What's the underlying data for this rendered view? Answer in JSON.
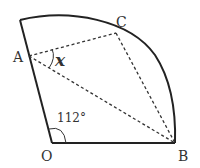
{
  "diagram": {
    "type": "geometry-sector",
    "points": {
      "O": {
        "label": "O",
        "x": 52,
        "y": 143
      },
      "B": {
        "label": "B",
        "x": 175,
        "y": 143
      },
      "A": {
        "label": "A",
        "x": 29,
        "y": 56
      },
      "C": {
        "label": "C",
        "x": 116,
        "y": 33
      },
      "T": {
        "x": 20,
        "y": 20
      }
    },
    "angle_O": {
      "label": "112°",
      "value": 112
    },
    "unknown_angle": {
      "label": "x",
      "vertex": "A"
    },
    "solid_segments": [
      "O-B",
      "O-T"
    ],
    "arc": "T-C-B",
    "dashed_segments": [
      "A-C",
      "A-B",
      "C-B"
    ],
    "colors": {
      "stroke": "#222222",
      "text": "#333333",
      "background": "#ffffff"
    }
  }
}
